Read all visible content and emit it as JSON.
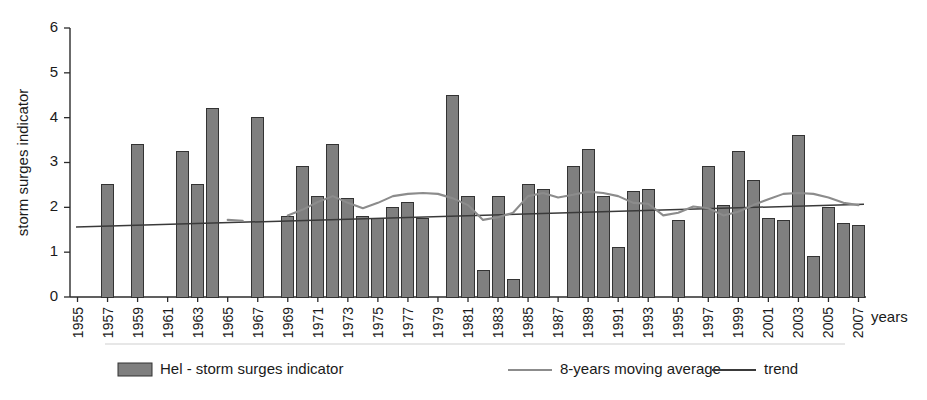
{
  "chart_data": {
    "type": "bar",
    "title": "",
    "subtitle": "",
    "xlabel": "years",
    "ylabel": "storm surges indicator",
    "ylim": [
      0,
      6
    ],
    "ytick_values": [
      0,
      1,
      2,
      3,
      4,
      5,
      6
    ],
    "ytick_labels": [
      "0",
      "1",
      "2",
      "3",
      "4",
      "5",
      "6"
    ],
    "grid": false,
    "legend_position": "bottom",
    "xlim_years": [
      1955,
      2008
    ],
    "xtick_step_years": 2,
    "categories": [
      "1955",
      "1956",
      "1957",
      "1958",
      "1959",
      "1960",
      "1961",
      "1962",
      "1963",
      "1964",
      "1965",
      "1966",
      "1967",
      "1968",
      "1969",
      "1970",
      "1971",
      "1972",
      "1973",
      "1974",
      "1975",
      "1976",
      "1977",
      "1978",
      "1979",
      "1980",
      "1981",
      "1982",
      "1983",
      "1984",
      "1985",
      "1986",
      "1987",
      "1988",
      "1989",
      "1990",
      "1991",
      "1992",
      "1993",
      "1994",
      "1995",
      "1996",
      "1997",
      "1998",
      "1999",
      "2000",
      "2001",
      "2002",
      "2003",
      "2004",
      "2005",
      "2006",
      "2007"
    ],
    "xtick_labels": [
      "1955",
      "1957",
      "1959",
      "1961",
      "1963",
      "1965",
      "1967",
      "1969",
      "1971",
      "1973",
      "1975",
      "1977",
      "1979",
      "1981",
      "1983",
      "1985",
      "1987",
      "1989",
      "1991",
      "1993",
      "1995",
      "1997",
      "1999",
      "2001",
      "2003",
      "2005",
      "2007"
    ],
    "series": [
      {
        "name": "Hel - storm surges indicator",
        "type": "bar",
        "color": "#7f7f7f",
        "values": [
          null,
          null,
          2.5,
          null,
          3.4,
          null,
          null,
          3.25,
          2.5,
          4.2,
          null,
          null,
          4.0,
          null,
          1.8,
          2.9,
          2.25,
          3.4,
          2.2,
          1.8,
          1.75,
          2.0,
          2.1,
          1.75,
          null,
          4.5,
          2.25,
          0.6,
          2.25,
          0.4,
          2.5,
          2.4,
          null,
          2.9,
          3.3,
          2.25,
          1.1,
          2.35,
          2.4,
          null,
          1.7,
          null,
          2.9,
          2.05,
          3.25,
          2.6,
          1.75,
          1.7,
          3.6,
          0.9,
          2.0,
          1.65,
          1.6
        ]
      },
      {
        "name": "8-years moving average",
        "type": "line",
        "color": "#8c8c8c",
        "values": [
          null,
          null,
          null,
          null,
          null,
          null,
          null,
          null,
          null,
          null,
          1.72,
          1.7,
          null,
          null,
          1.82,
          1.95,
          2.12,
          2.25,
          2.1,
          1.98,
          2.1,
          2.25,
          2.3,
          2.32,
          2.3,
          2.2,
          2.05,
          1.72,
          1.78,
          1.88,
          2.25,
          2.32,
          2.22,
          2.28,
          2.35,
          2.32,
          2.25,
          2.1,
          2.08,
          1.82,
          1.88,
          2.02,
          1.98,
          1.82,
          1.9,
          2.05,
          2.18,
          2.3,
          2.32,
          2.3,
          2.22,
          2.1,
          2.05
        ]
      },
      {
        "name": "trend",
        "type": "line",
        "color": "#3a3a3a",
        "endpoints": [
          {
            "x": "1955",
            "y": 1.56
          },
          {
            "x": "2007",
            "y": 2.07
          }
        ]
      }
    ],
    "legend": [
      {
        "label": "Hel - storm surges indicator",
        "marker": "bar-swatch",
        "color": "#7f7f7f"
      },
      {
        "label": "8-years moving average",
        "marker": "line",
        "color": "#8c8c8c"
      },
      {
        "label": "trend",
        "marker": "line",
        "color": "#3a3a3a"
      }
    ]
  },
  "colors": {
    "bar_fill": "#7f7f7f",
    "bar_stroke": "#333333",
    "moving_average": "#8c8c8c",
    "trend": "#3a3a3a",
    "axis": "#2b2b2b",
    "background": "#ffffff"
  }
}
